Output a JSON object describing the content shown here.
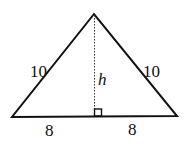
{
  "diagram": {
    "type": "isosceles-triangle-with-altitude",
    "vertices": {
      "apex": [
        94,
        14
      ],
      "left": [
        12,
        117
      ],
      "right": [
        177,
        116
      ]
    },
    "altitude_foot": [
      94,
      116
    ],
    "labels": {
      "left_side": "10",
      "right_side": "10",
      "height": "h",
      "left_base": "8",
      "right_base": "8"
    },
    "colors": {
      "stroke": "#111111",
      "background": "#ffffff"
    }
  }
}
